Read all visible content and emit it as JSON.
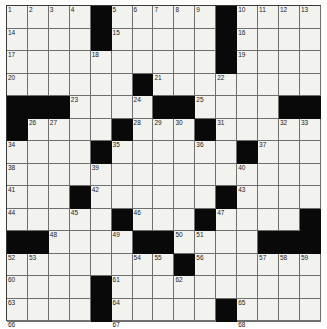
{
  "puzzle": {
    "title": "Crossword Grid",
    "columns": 15,
    "rows": 14,
    "cell_size_px": 20.8,
    "colors": {
      "white_cell": "#f2f2ef",
      "black_cell": "#090909",
      "grid_line": "#6f6f6f",
      "border": "#3a3a3a",
      "number_text": "#1a1a1a",
      "page_background": "#fdfdfb"
    },
    "highest_number": 68,
    "grid": [
      [
        {
          "black": false,
          "num": "1"
        },
        {
          "black": false,
          "num": "2"
        },
        {
          "black": false,
          "num": "3"
        },
        {
          "black": false,
          "num": "4"
        },
        {
          "black": true,
          "num": ""
        },
        {
          "black": false,
          "num": "5"
        },
        {
          "black": false,
          "num": "6"
        },
        {
          "black": false,
          "num": "7"
        },
        {
          "black": false,
          "num": "8"
        },
        {
          "black": false,
          "num": "9"
        },
        {
          "black": true,
          "num": ""
        },
        {
          "black": false,
          "num": "10"
        },
        {
          "black": false,
          "num": "11"
        },
        {
          "black": false,
          "num": "12"
        },
        {
          "black": false,
          "num": "13"
        }
      ],
      [
        {
          "black": false,
          "num": "14"
        },
        {
          "black": false,
          "num": ""
        },
        {
          "black": false,
          "num": ""
        },
        {
          "black": false,
          "num": ""
        },
        {
          "black": true,
          "num": ""
        },
        {
          "black": false,
          "num": "15"
        },
        {
          "black": false,
          "num": ""
        },
        {
          "black": false,
          "num": ""
        },
        {
          "black": false,
          "num": ""
        },
        {
          "black": false,
          "num": ""
        },
        {
          "black": true,
          "num": ""
        },
        {
          "black": false,
          "num": "16"
        },
        {
          "black": false,
          "num": ""
        },
        {
          "black": false,
          "num": ""
        },
        {
          "black": false,
          "num": ""
        }
      ],
      [
        {
          "black": false,
          "num": "17"
        },
        {
          "black": false,
          "num": ""
        },
        {
          "black": false,
          "num": ""
        },
        {
          "black": false,
          "num": ""
        },
        {
          "black": false,
          "num": "18"
        },
        {
          "black": false,
          "num": ""
        },
        {
          "black": false,
          "num": ""
        },
        {
          "black": false,
          "num": ""
        },
        {
          "black": false,
          "num": ""
        },
        {
          "black": false,
          "num": ""
        },
        {
          "black": true,
          "num": ""
        },
        {
          "black": false,
          "num": "19"
        },
        {
          "black": false,
          "num": ""
        },
        {
          "black": false,
          "num": ""
        },
        {
          "black": false,
          "num": ""
        }
      ],
      [
        {
          "black": false,
          "num": "20"
        },
        {
          "black": false,
          "num": ""
        },
        {
          "black": false,
          "num": ""
        },
        {
          "black": false,
          "num": ""
        },
        {
          "black": false,
          "num": ""
        },
        {
          "black": false,
          "num": ""
        },
        {
          "black": true,
          "num": ""
        },
        {
          "black": false,
          "num": "21"
        },
        {
          "black": false,
          "num": ""
        },
        {
          "black": false,
          "num": ""
        },
        {
          "black": false,
          "num": "22"
        },
        {
          "black": false,
          "num": ""
        },
        {
          "black": false,
          "num": ""
        },
        {
          "black": false,
          "num": ""
        },
        {
          "black": false,
          "num": ""
        }
      ],
      [
        {
          "black": true,
          "num": ""
        },
        {
          "black": true,
          "num": ""
        },
        {
          "black": true,
          "num": ""
        },
        {
          "black": false,
          "num": "23"
        },
        {
          "black": false,
          "num": ""
        },
        {
          "black": false,
          "num": ""
        },
        {
          "black": false,
          "num": "24"
        },
        {
          "black": true,
          "num": ""
        },
        {
          "black": true,
          "num": ""
        },
        {
          "black": false,
          "num": "25"
        },
        {
          "black": false,
          "num": ""
        },
        {
          "black": false,
          "num": ""
        },
        {
          "black": false,
          "num": ""
        },
        {
          "black": true,
          "num": ""
        },
        {
          "black": true,
          "num": ""
        }
      ],
      [
        {
          "black": true,
          "num": ""
        },
        {
          "black": false,
          "num": "26"
        },
        {
          "black": false,
          "num": "27"
        },
        {
          "black": false,
          "num": ""
        },
        {
          "black": false,
          "num": ""
        },
        {
          "black": true,
          "num": ""
        },
        {
          "black": false,
          "num": "28"
        },
        {
          "black": false,
          "num": "29"
        },
        {
          "black": false,
          "num": "30"
        },
        {
          "black": true,
          "num": ""
        },
        {
          "black": false,
          "num": "31"
        },
        {
          "black": false,
          "num": ""
        },
        {
          "black": false,
          "num": ""
        },
        {
          "black": false,
          "num": "32"
        },
        {
          "black": false,
          "num": "33"
        }
      ],
      [
        {
          "black": false,
          "num": "34"
        },
        {
          "black": false,
          "num": ""
        },
        {
          "black": false,
          "num": ""
        },
        {
          "black": false,
          "num": ""
        },
        {
          "black": true,
          "num": ""
        },
        {
          "black": false,
          "num": "35"
        },
        {
          "black": false,
          "num": ""
        },
        {
          "black": false,
          "num": ""
        },
        {
          "black": false,
          "num": ""
        },
        {
          "black": false,
          "num": "36"
        },
        {
          "black": false,
          "num": ""
        },
        {
          "black": true,
          "num": ""
        },
        {
          "black": false,
          "num": "37"
        },
        {
          "black": false,
          "num": ""
        },
        {
          "black": false,
          "num": ""
        }
      ],
      [
        {
          "black": false,
          "num": "38"
        },
        {
          "black": false,
          "num": ""
        },
        {
          "black": false,
          "num": ""
        },
        {
          "black": false,
          "num": ""
        },
        {
          "black": false,
          "num": "39"
        },
        {
          "black": false,
          "num": ""
        },
        {
          "black": false,
          "num": ""
        },
        {
          "black": false,
          "num": ""
        },
        {
          "black": false,
          "num": ""
        },
        {
          "black": false,
          "num": ""
        },
        {
          "black": false,
          "num": ""
        },
        {
          "black": false,
          "num": "40"
        },
        {
          "black": false,
          "num": ""
        },
        {
          "black": false,
          "num": ""
        },
        {
          "black": false,
          "num": ""
        }
      ],
      [
        {
          "black": false,
          "num": "41"
        },
        {
          "black": false,
          "num": ""
        },
        {
          "black": false,
          "num": ""
        },
        {
          "black": true,
          "num": ""
        },
        {
          "black": false,
          "num": "42"
        },
        {
          "black": false,
          "num": ""
        },
        {
          "black": false,
          "num": ""
        },
        {
          "black": false,
          "num": ""
        },
        {
          "black": false,
          "num": ""
        },
        {
          "black": false,
          "num": ""
        },
        {
          "black": true,
          "num": ""
        },
        {
          "black": false,
          "num": "43"
        },
        {
          "black": false,
          "num": ""
        },
        {
          "black": false,
          "num": ""
        },
        {
          "black": false,
          "num": ""
        }
      ],
      [
        {
          "black": false,
          "num": "44"
        },
        {
          "black": false,
          "num": ""
        },
        {
          "black": false,
          "num": ""
        },
        {
          "black": false,
          "num": "45"
        },
        {
          "black": false,
          "num": ""
        },
        {
          "black": true,
          "num": ""
        },
        {
          "black": false,
          "num": "46"
        },
        {
          "black": false,
          "num": ""
        },
        {
          "black": false,
          "num": ""
        },
        {
          "black": true,
          "num": ""
        },
        {
          "black": false,
          "num": "47"
        },
        {
          "black": false,
          "num": ""
        },
        {
          "black": false,
          "num": ""
        },
        {
          "black": false,
          "num": ""
        },
        {
          "black": true,
          "num": ""
        }
      ],
      [
        {
          "black": true,
          "num": ""
        },
        {
          "black": true,
          "num": ""
        },
        {
          "black": false,
          "num": "48"
        },
        {
          "black": false,
          "num": ""
        },
        {
          "black": false,
          "num": ""
        },
        {
          "black": false,
          "num": "49"
        },
        {
          "black": true,
          "num": ""
        },
        {
          "black": true,
          "num": ""
        },
        {
          "black": false,
          "num": "50"
        },
        {
          "black": false,
          "num": "51"
        },
        {
          "black": false,
          "num": ""
        },
        {
          "black": false,
          "num": ""
        },
        {
          "black": true,
          "num": ""
        },
        {
          "black": true,
          "num": ""
        },
        {
          "black": true,
          "num": ""
        }
      ],
      [
        {
          "black": false,
          "num": "52"
        },
        {
          "black": false,
          "num": "53"
        },
        {
          "black": false,
          "num": ""
        },
        {
          "black": false,
          "num": ""
        },
        {
          "black": false,
          "num": ""
        },
        {
          "black": false,
          "num": ""
        },
        {
          "black": false,
          "num": "54"
        },
        {
          "black": false,
          "num": "55"
        },
        {
          "black": true,
          "num": ""
        },
        {
          "black": false,
          "num": "56"
        },
        {
          "black": false,
          "num": ""
        },
        {
          "black": false,
          "num": ""
        },
        {
          "black": false,
          "num": "57"
        },
        {
          "black": false,
          "num": "58"
        },
        {
          "black": false,
          "num": "59"
        }
      ],
      [
        {
          "black": false,
          "num": "60"
        },
        {
          "black": false,
          "num": ""
        },
        {
          "black": false,
          "num": ""
        },
        {
          "black": false,
          "num": ""
        },
        {
          "black": true,
          "num": ""
        },
        {
          "black": false,
          "num": "61"
        },
        {
          "black": false,
          "num": ""
        },
        {
          "black": false,
          "num": ""
        },
        {
          "black": false,
          "num": "62"
        },
        {
          "black": false,
          "num": ""
        },
        {
          "black": false,
          "num": ""
        },
        {
          "black": false,
          "num": ""
        },
        {
          "black": false,
          "num": ""
        },
        {
          "black": false,
          "num": ""
        },
        {
          "black": false,
          "num": ""
        }
      ],
      [
        {
          "black": false,
          "num": "63"
        },
        {
          "black": false,
          "num": ""
        },
        {
          "black": false,
          "num": ""
        },
        {
          "black": false,
          "num": ""
        },
        {
          "black": true,
          "num": ""
        },
        {
          "black": false,
          "num": "64"
        },
        {
          "black": false,
          "num": ""
        },
        {
          "black": false,
          "num": ""
        },
        {
          "black": false,
          "num": ""
        },
        {
          "black": false,
          "num": ""
        },
        {
          "black": true,
          "num": ""
        },
        {
          "black": false,
          "num": "65"
        },
        {
          "black": false,
          "num": ""
        },
        {
          "black": false,
          "num": ""
        },
        {
          "black": false,
          "num": ""
        }
      ],
      [
        {
          "black": false,
          "num": "66"
        },
        {
          "black": false,
          "num": ""
        },
        {
          "black": false,
          "num": ""
        },
        {
          "black": false,
          "num": ""
        },
        {
          "black": true,
          "num": ""
        },
        {
          "black": false,
          "num": "67"
        },
        {
          "black": false,
          "num": ""
        },
        {
          "black": false,
          "num": ""
        },
        {
          "black": false,
          "num": ""
        },
        {
          "black": false,
          "num": ""
        },
        {
          "black": true,
          "num": ""
        },
        {
          "black": false,
          "num": "68"
        },
        {
          "black": false,
          "num": ""
        },
        {
          "black": false,
          "num": ""
        },
        {
          "black": false,
          "num": ""
        }
      ]
    ]
  }
}
